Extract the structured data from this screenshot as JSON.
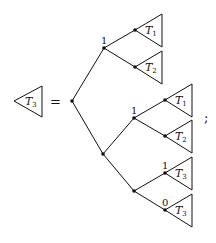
{
  "diagram": {
    "lhs": {
      "label": "T",
      "subscript": "3"
    },
    "equals": "=",
    "terminator": ";",
    "root": {
      "x": 72,
      "y": 101
    },
    "nodes": [
      {
        "id": "root",
        "x": 72,
        "y": 101,
        "label": ""
      },
      {
        "id": "a",
        "x": 104,
        "y": 48,
        "label": "1"
      },
      {
        "id": "a1",
        "x": 135,
        "y": 30,
        "label": ""
      },
      {
        "id": "a2",
        "x": 135,
        "y": 67,
        "label": ""
      },
      {
        "id": "b",
        "x": 103,
        "y": 154,
        "label": ""
      },
      {
        "id": "c",
        "x": 134,
        "y": 118,
        "label": "1"
      },
      {
        "id": "c1",
        "x": 165,
        "y": 100,
        "label": ""
      },
      {
        "id": "c2",
        "x": 165,
        "y": 136,
        "label": ""
      },
      {
        "id": "d",
        "x": 134,
        "y": 191,
        "label": ""
      },
      {
        "id": "d1",
        "x": 165,
        "y": 173,
        "label": "1"
      },
      {
        "id": "d2",
        "x": 165,
        "y": 210,
        "label": "0"
      }
    ],
    "edges": [
      [
        "root",
        "a"
      ],
      [
        "root",
        "b"
      ],
      [
        "a",
        "a1"
      ],
      [
        "a",
        "a2"
      ],
      [
        "b",
        "c"
      ],
      [
        "b",
        "d"
      ],
      [
        "c",
        "c1"
      ],
      [
        "c",
        "c2"
      ],
      [
        "d",
        "d1"
      ],
      [
        "d",
        "d2"
      ]
    ],
    "subtrees": [
      {
        "attach": "a1",
        "label": "T",
        "subscript": "1"
      },
      {
        "attach": "a2",
        "label": "T",
        "subscript": "2"
      },
      {
        "attach": "c1",
        "label": "T",
        "subscript": "1"
      },
      {
        "attach": "c2",
        "label": "T",
        "subscript": "2"
      },
      {
        "attach": "d1",
        "label": "T",
        "subscript": "3"
      },
      {
        "attach": "d2",
        "label": "T",
        "subscript": "3"
      }
    ],
    "colors": {
      "ink": "#111111",
      "background": "#ffffff"
    }
  }
}
